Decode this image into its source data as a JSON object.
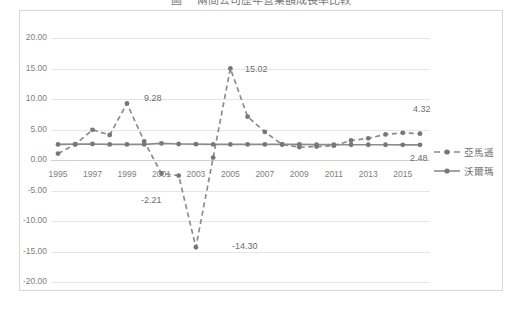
{
  "title": "圖一  兩間公司歷年營業額成長率比較",
  "legend": {
    "position": "right",
    "items": [
      {
        "name": "亞馬遜",
        "style": "dashed",
        "color": "#8c8c8c"
      },
      {
        "name": "沃爾瑪",
        "style": "solid",
        "color": "#8c8c8c"
      }
    ]
  },
  "axis": {
    "y_ticks": [
      "20.00",
      "15.00",
      "10.00",
      "5.00",
      "0.00",
      "-5.00",
      "-10.00",
      "-15.00",
      "-20.00"
    ],
    "x_ticks": [
      "1995",
      "1997",
      "1999",
      "2001",
      "2003",
      "2005",
      "2007",
      "2009",
      "2011",
      "2013",
      "2015"
    ]
  },
  "annotations": [
    {
      "text": "9.28",
      "x": 143,
      "y": 92
    },
    {
      "text": "15.02",
      "x": 244,
      "y": 63
    },
    {
      "text": "-2.21",
      "x": 140,
      "y": 194
    },
    {
      "text": "-14.30",
      "x": 231,
      "y": 240
    },
    {
      "text": "4.32",
      "x": 412,
      "y": 103
    },
    {
      "text": "2.48",
      "x": 409,
      "y": 152
    }
  ],
  "colors": {
    "series": "#8c8c8c",
    "marker": "#777777",
    "grid": "#e6e6e6",
    "border": "#d7d7d7",
    "text": "#808080"
  },
  "chart_data": {
    "type": "line",
    "title": "圖一  兩間公司歷年營業額成長率比較",
    "xlabel": "",
    "ylabel": "",
    "ylim": [
      -20,
      20
    ],
    "grid": true,
    "legend_position": "right",
    "x": [
      1995,
      1996,
      1997,
      1998,
      1999,
      2000,
      2001,
      2002,
      2003,
      2004,
      2005,
      2006,
      2007,
      2008,
      2009,
      2010,
      2011,
      2012,
      2013,
      2014,
      2015,
      2016
    ],
    "series": [
      {
        "name": "亞馬遜",
        "style": "dashed",
        "values": [
          1.05,
          2.55,
          4.95,
          4.1,
          9.28,
          3.05,
          -2.21,
          -2.55,
          -14.3,
          0.4,
          15.02,
          7.1,
          4.6,
          2.55,
          2.1,
          2.2,
          2.35,
          3.2,
          3.55,
          4.2,
          4.45,
          4.32
        ]
      },
      {
        "name": "沃爾瑪",
        "style": "solid",
        "values": [
          2.55,
          2.6,
          2.62,
          2.55,
          2.55,
          2.55,
          2.72,
          2.62,
          2.6,
          2.55,
          2.55,
          2.55,
          2.55,
          2.55,
          2.55,
          2.52,
          2.52,
          2.5,
          2.5,
          2.5,
          2.48,
          2.48
        ]
      }
    ],
    "labeled_points": [
      {
        "series": "亞馬遜",
        "x": 1999,
        "value": 9.28
      },
      {
        "series": "亞馬遜",
        "x": 2001,
        "value": -2.21
      },
      {
        "series": "亞馬遜",
        "x": 2003,
        "value": -14.3
      },
      {
        "series": "亞馬遜",
        "x": 2005,
        "value": 15.02
      },
      {
        "series": "亞馬遜",
        "x": 2016,
        "value": 4.32
      },
      {
        "series": "沃爾瑪",
        "x": 2016,
        "value": 2.48
      }
    ]
  }
}
